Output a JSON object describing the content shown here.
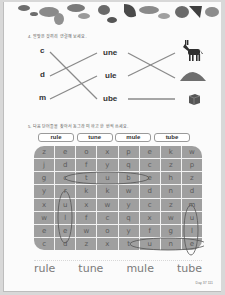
{
  "section4": {
    "instruction": "4. 알맞은 것끼리 연결해 보세요.",
    "letters": [
      "c",
      "d",
      "m"
    ],
    "suffixes": [
      "une",
      "ule",
      "ube"
    ],
    "pictures": [
      "donkey-mule",
      "sand-dune",
      "cube"
    ],
    "connections": [
      {
        "letter": "c",
        "suffix": "ube"
      },
      {
        "letter": "d",
        "suffix": "une"
      },
      {
        "letter": "m",
        "suffix": "ule"
      },
      {
        "suffix": "une",
        "picture": "sand-dune"
      },
      {
        "suffix": "ule",
        "picture": "donkey-mule"
      },
      {
        "suffix": "ube",
        "picture": "cube"
      }
    ]
  },
  "section5": {
    "instruction": "5. 다음 단어들을 찾아서 동그라미 하고 한 번씩 쓰세요.",
    "words": [
      "rule",
      "tune",
      "mule",
      "tube"
    ],
    "grid": [
      [
        "z",
        "e",
        "o",
        "x",
        "p",
        "e",
        "k",
        "w"
      ],
      [
        "j",
        "d",
        "f",
        "y",
        "q",
        "c",
        "z",
        "p"
      ],
      [
        "g",
        "c",
        "t",
        "u",
        "b",
        "e",
        "h",
        "z"
      ],
      [
        "y",
        "r",
        "k",
        "k",
        "w",
        "d",
        "n",
        "d"
      ],
      [
        "x",
        "u",
        "x",
        "w",
        "y",
        "c",
        "z",
        "m"
      ],
      [
        "w",
        "l",
        "f",
        "c",
        "q",
        "x",
        "w",
        "u"
      ],
      [
        "e",
        "e",
        "w",
        "o",
        "y",
        "f",
        "g",
        "l"
      ],
      [
        "c",
        "d",
        "z",
        "x",
        "t",
        "u",
        "n",
        "e"
      ]
    ],
    "written_answers": [
      "rule",
      "tune",
      "mule",
      "tube"
    ]
  },
  "footer": {
    "page_label": "Day 37  111"
  }
}
